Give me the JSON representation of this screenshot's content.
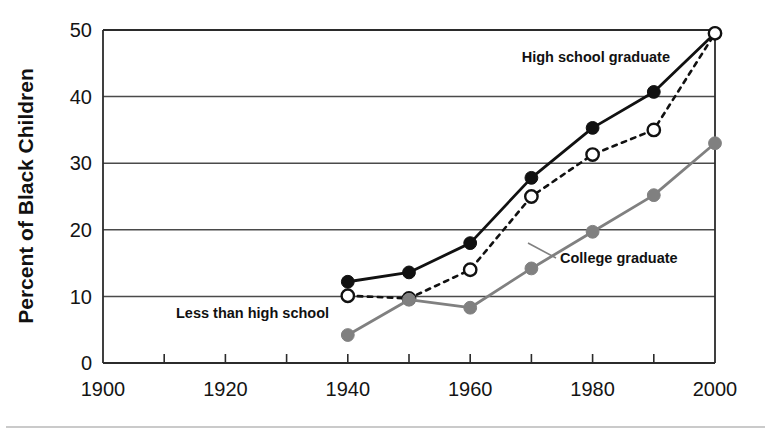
{
  "chart_data": {
    "type": "line",
    "title": "",
    "subtitle": "",
    "xlabel": "",
    "ylabel": "Percent of Black Children",
    "xlim": [
      1900,
      2000
    ],
    "ylim": [
      0,
      50
    ],
    "yticks": [
      0,
      10,
      20,
      30,
      40,
      50
    ],
    "ytick_labels": [
      "0",
      "10",
      "20",
      "30",
      "40",
      "50"
    ],
    "xticks": [
      1900,
      1910,
      1920,
      1930,
      1940,
      1950,
      1960,
      1970,
      1980,
      1990,
      2000
    ],
    "xtick_labels": [
      "1900",
      "",
      "1920",
      "",
      "1940",
      "",
      "1960",
      "",
      "1980",
      "",
      "2000"
    ],
    "xtick_labels_major": [
      "1900",
      "1920",
      "1940",
      "1960",
      "1980",
      "2000"
    ],
    "grid": true,
    "grid_axis": "y",
    "legend": "inline-annotations",
    "x": [
      1940,
      1950,
      1960,
      1970,
      1980,
      1990,
      2000
    ],
    "series": [
      {
        "name": "High school graduate",
        "style": "solid",
        "color": "#111111",
        "marker": "filled-circle",
        "x": [
          1940,
          1950,
          1960,
          1970,
          1980,
          1990,
          2000
        ],
        "values": [
          12.2,
          13.6,
          18.0,
          27.8,
          35.3,
          40.7,
          49.5
        ]
      },
      {
        "name": "Less than high school",
        "style": "dashed",
        "color": "#111111",
        "marker": "open-circle",
        "x": [
          1940,
          1950,
          1960,
          1970,
          1980,
          1990,
          2000
        ],
        "values": [
          10.1,
          9.7,
          14.0,
          25.0,
          31.3,
          35.0,
          49.5
        ]
      },
      {
        "name": "College graduate",
        "style": "solid",
        "color": "#808080",
        "marker": "gray-circle",
        "x": [
          1940,
          1950,
          1960,
          1970,
          1980,
          1990,
          2000
        ],
        "values": [
          4.2,
          9.5,
          8.3,
          14.2,
          19.7,
          25.2,
          33.0
        ]
      }
    ],
    "annotations": [
      {
        "text": "High school graduate",
        "series": "High school graduate",
        "anchor": "end",
        "x_px": 670,
        "y_px": 62
      },
      {
        "text": "Less than high school",
        "series": "Less than high school",
        "anchor": "start",
        "x_px": 176,
        "y_px": 318
      },
      {
        "text": "College graduate",
        "series": "College graduate",
        "anchor": "start",
        "x_px": 560,
        "y_px": 263
      }
    ]
  },
  "axes": {
    "y_title": "Percent of Black Children",
    "y_tick_labels": [
      "50",
      "40",
      "30",
      "20",
      "10",
      "0"
    ],
    "x_tick_labels": [
      "1900",
      "1920",
      "1940",
      "1960",
      "1980",
      "2000"
    ]
  },
  "colors": {
    "black": "#111111",
    "gray": "#808080",
    "grid": "#4a4a4a",
    "axis": "#2b2b2b",
    "background": "#ffffff",
    "foot_rule": "#b9b9b9"
  }
}
